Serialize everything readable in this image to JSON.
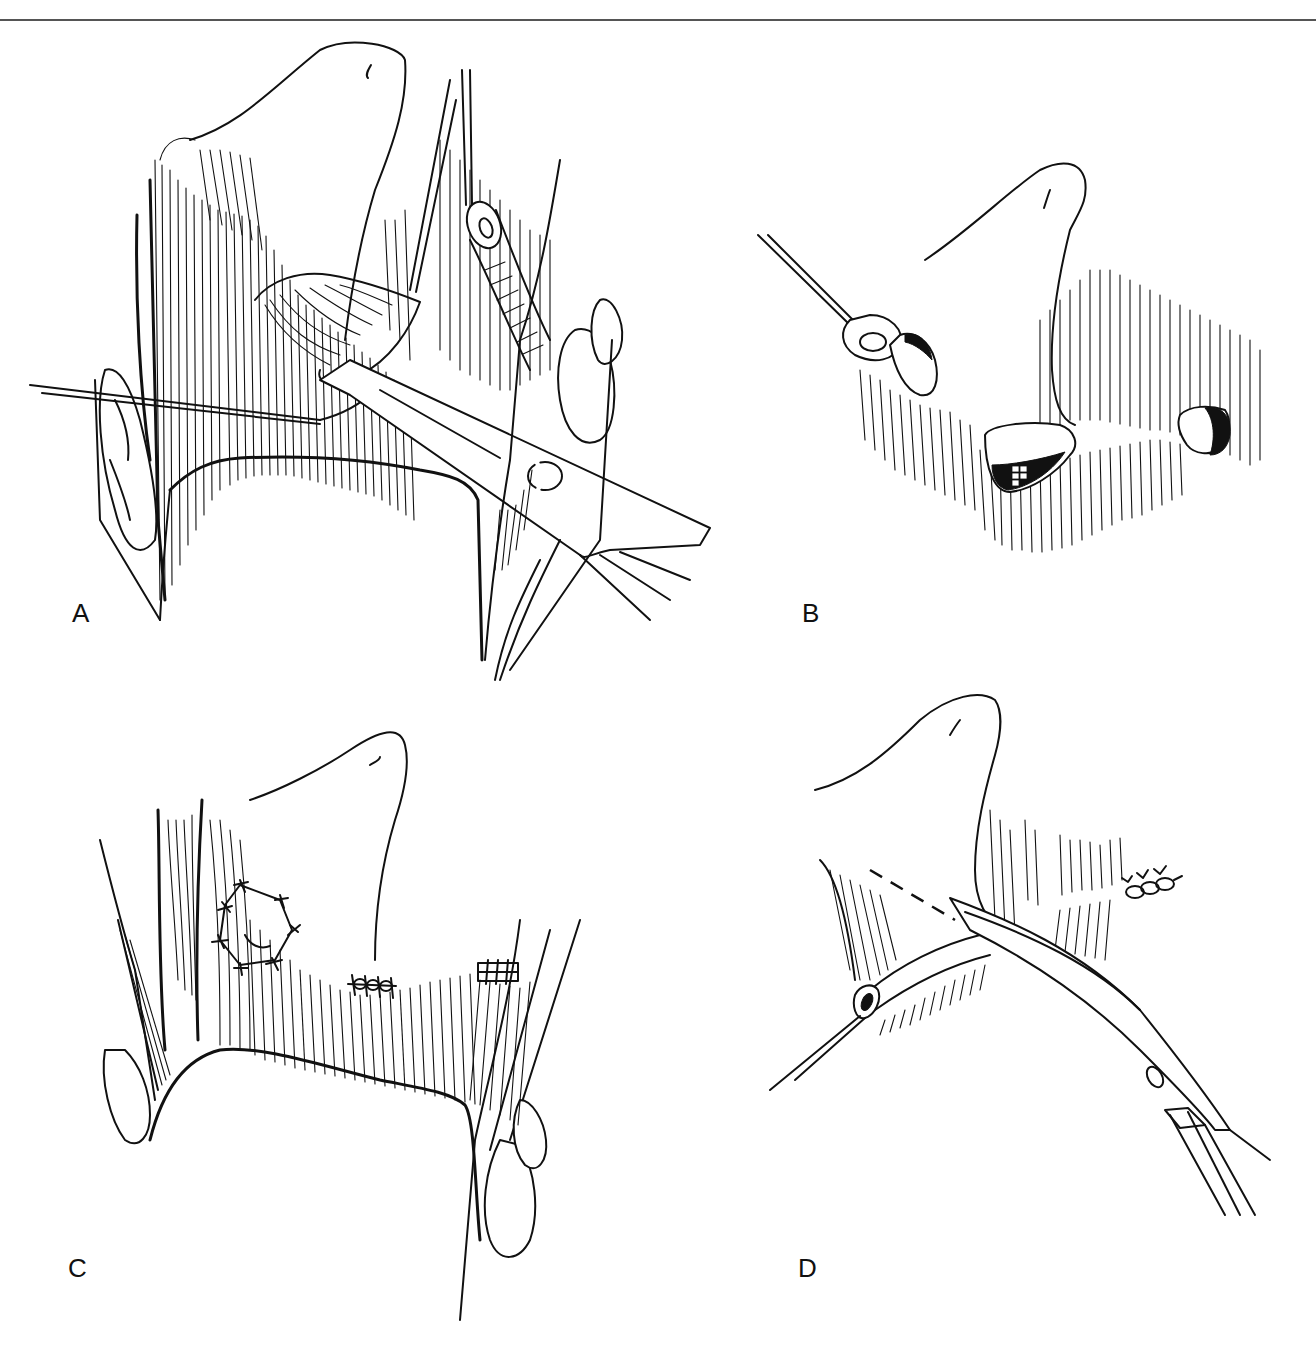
{
  "figure": {
    "type": "surgical-line-illustration",
    "panel_count": 4,
    "colors": {
      "ink": "#111111",
      "background": "#ffffff",
      "rule": "#555555"
    }
  },
  "panels": [
    {
      "id": "A",
      "label": "A",
      "description": "Retractor and traction suture exposing structure beneath flap; vessel held by loop at top"
    },
    {
      "id": "B",
      "label": "B",
      "description": "Three openings along hatched tissue; vessel end held by suture at left"
    },
    {
      "id": "C",
      "label": "C",
      "description": "Closure with interrupted sutures (octagonal patch and two short suture lines)"
    },
    {
      "id": "D",
      "label": "D",
      "description": "Curved instrument passing behind vessel; dashed incision line; suture row at right"
    }
  ]
}
